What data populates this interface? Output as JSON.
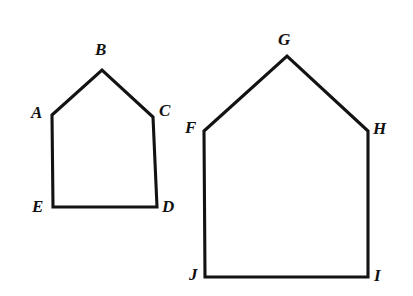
{
  "figure": {
    "background_color": "#ffffff",
    "stroke_color": "#131313",
    "label_color": "#101010",
    "stroke_width": 3.1,
    "canvas": {
      "width": 413,
      "height": 296
    }
  },
  "shapes": [
    {
      "name": "pentagon-abcde",
      "label": "ABCDE",
      "kind": "pentagon",
      "path": "M 52 115 L 102 70 L 153 117 L 157 207 L 53 207 Z",
      "vertices": [
        {
          "id": "A",
          "x": 52,
          "y": 115
        },
        {
          "id": "B",
          "x": 102,
          "y": 70
        },
        {
          "id": "C",
          "x": 153,
          "y": 117
        },
        {
          "id": "D",
          "x": 157,
          "y": 207
        },
        {
          "id": "E",
          "x": 53,
          "y": 207
        }
      ]
    },
    {
      "name": "pentagon-fghij",
      "label": "FGHIJ",
      "kind": "pentagon",
      "path": "M 204 131 L 287 56 L 368 131 L 368 277 L 205 277 Z",
      "vertices": [
        {
          "id": "F",
          "x": 204,
          "y": 131
        },
        {
          "id": "G",
          "x": 287,
          "y": 56
        },
        {
          "id": "H",
          "x": 368,
          "y": 131
        },
        {
          "id": "I",
          "x": 368,
          "y": 277
        },
        {
          "id": "J",
          "x": 205,
          "y": 277
        }
      ]
    }
  ],
  "labels": [
    {
      "id": "A",
      "text": "A",
      "x": 31,
      "y": 104
    },
    {
      "id": "B",
      "text": "B",
      "x": 95,
      "y": 41
    },
    {
      "id": "C",
      "text": "C",
      "x": 159,
      "y": 102
    },
    {
      "id": "D",
      "text": "D",
      "x": 162,
      "y": 198
    },
    {
      "id": "E",
      "text": "E",
      "x": 32,
      "y": 198
    },
    {
      "id": "F",
      "text": "F",
      "x": 185,
      "y": 119
    },
    {
      "id": "G",
      "text": "G",
      "x": 278,
      "y": 31
    },
    {
      "id": "H",
      "text": "H",
      "x": 373,
      "y": 120
    },
    {
      "id": "I",
      "text": "I",
      "x": 374,
      "y": 267
    },
    {
      "id": "J",
      "text": "J",
      "x": 189,
      "y": 266
    }
  ]
}
